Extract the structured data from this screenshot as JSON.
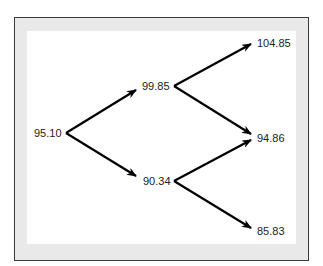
{
  "diagram": {
    "type": "binomial-tree",
    "nodes": {
      "root": "95.10",
      "up1": "99.85",
      "down1": "90.34",
      "uu": "104.85",
      "ud": "94.86",
      "dd": "85.83"
    },
    "edges": [
      {
        "from": "95.10",
        "to": "99.85"
      },
      {
        "from": "95.10",
        "to": "90.34"
      },
      {
        "from": "99.85",
        "to": "104.85"
      },
      {
        "from": "99.85",
        "to": "94.86"
      },
      {
        "from": "90.34",
        "to": "94.86"
      },
      {
        "from": "90.34",
        "to": "85.83"
      }
    ],
    "colors": {
      "frame_border": "#3a3a3a",
      "frame_fill": "#e9e9e9",
      "panel": "#ffffff",
      "arrow": "#000000",
      "text": "#222222"
    }
  }
}
